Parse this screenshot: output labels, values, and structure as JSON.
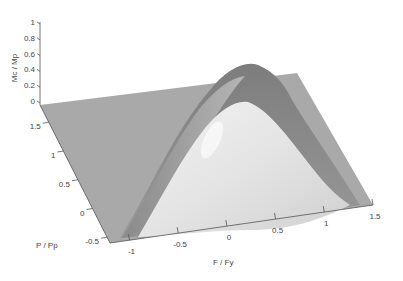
{
  "chart_data": {
    "type": "surface",
    "title": "",
    "xlabel": "F / Fy",
    "ylabel": "P / Pp",
    "zlabel": "Mc / Mp",
    "x_ticks": [
      "-1",
      "-0.5",
      "0",
      "0.5",
      "1",
      "1.5"
    ],
    "x_tick_values": [
      -1,
      -0.5,
      0,
      0.5,
      1,
      1.5
    ],
    "y_ticks": [
      "-0.5",
      "0",
      "0.5",
      "1",
      "1.5"
    ],
    "y_tick_values": [
      -0.5,
      0,
      0.5,
      1,
      1.5
    ],
    "z_ticks": [
      "0",
      "0.2",
      "0.4",
      "0.6",
      "0.8",
      "1"
    ],
    "z_tick_values": [
      0,
      0.2,
      0.4,
      0.6,
      0.8,
      1
    ],
    "xlim": [
      -1.2,
      1.5
    ],
    "ylim": [
      -0.6,
      1.8
    ],
    "zlim": [
      0,
      1
    ],
    "surface_description": "Dome-shaped interaction surface rising from the base plane z=0, peaking near Mc/Mp = 1 at F/Fy = 0 along the P/Pp axis; surface is zero outside the dome region",
    "peak": {
      "x": 0,
      "y": 1.5,
      "z": 1
    },
    "colormap": "gray",
    "grid": false,
    "legend": "none"
  }
}
